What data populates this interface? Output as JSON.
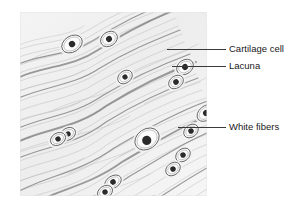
{
  "figure": {
    "background_color": "#ffffff",
    "ink_color": "#3a3a3a"
  },
  "illustration": {
    "name": "white-fibrocartilage-micrograph-drawing",
    "panel": {
      "x": 20,
      "y": 12,
      "width": 187,
      "height": 184
    },
    "fiber_color": "#8c8c8c",
    "lacuna_fill": "#fbfbfb",
    "nucleus_color": "#2b2b2b",
    "fiber_direction": "lower-left to upper-right wavy bundles",
    "cells": [
      {
        "cx": 52,
        "cy": 32,
        "rx": 11,
        "ry": 8,
        "rot": -32,
        "nx": 52,
        "ny": 32,
        "nr": 3.2
      },
      {
        "cx": 89,
        "cy": 27,
        "rx": 9,
        "ry": 7,
        "rot": -34,
        "nx": 89,
        "ny": 27,
        "nr": 3.0
      },
      {
        "cx": 105,
        "cy": 65,
        "rx": 8,
        "ry": 6,
        "rot": -38,
        "nx": 105,
        "ny": 65,
        "nr": 2.6
      },
      {
        "cx": 165,
        "cy": 55,
        "rx": 9,
        "ry": 7,
        "rot": -36,
        "nx": 165,
        "ny": 55,
        "nr": 3.0
      },
      {
        "cx": 156,
        "cy": 70,
        "rx": 8,
        "ry": 6,
        "rot": -36,
        "nx": 156,
        "ny": 70,
        "nr": 2.8
      },
      {
        "cx": 48,
        "cy": 122,
        "rx": 8,
        "ry": 6,
        "rot": -30,
        "nx": 48,
        "ny": 122,
        "nr": 2.7
      },
      {
        "cx": 38,
        "cy": 127,
        "rx": 8,
        "ry": 6,
        "rot": -30,
        "nx": 38,
        "ny": 127,
        "nr": 2.7
      },
      {
        "cx": 186,
        "cy": 101,
        "rx": 10,
        "ry": 7,
        "rot": -40,
        "nx": 186,
        "ny": 101,
        "nr": 3.0
      },
      {
        "cx": 171,
        "cy": 119,
        "rx": 8,
        "ry": 6,
        "rot": -38,
        "nx": 171,
        "ny": 119,
        "nr": 2.7
      },
      {
        "cx": 127,
        "cy": 127,
        "rx": 13,
        "ry": 10,
        "rot": -34,
        "nx": 126,
        "ny": 128,
        "nr": 4.6
      },
      {
        "cx": 163,
        "cy": 143,
        "rx": 8,
        "ry": 6,
        "rot": -38,
        "nx": 163,
        "ny": 143,
        "nr": 2.7
      },
      {
        "cx": 153,
        "cy": 157,
        "rx": 8,
        "ry": 6,
        "rot": -38,
        "nx": 153,
        "ny": 157,
        "nr": 2.7
      },
      {
        "cx": 93,
        "cy": 170,
        "rx": 9,
        "ry": 6,
        "rot": -32,
        "nx": 93,
        "ny": 170,
        "nr": 2.8
      },
      {
        "cx": 85,
        "cy": 180,
        "rx": 8,
        "ry": 6,
        "rot": -32,
        "nx": 85,
        "ny": 180,
        "nr": 2.7
      },
      {
        "cx": 131,
        "cy": 192,
        "rx": 10,
        "ry": 7,
        "rot": -30,
        "nx": 129,
        "ny": 193,
        "nr": 3.2
      },
      {
        "cx": 198,
        "cy": 126,
        "rx": 8,
        "ry": 6,
        "rot": -42,
        "nx": 198,
        "ny": 126,
        "nr": 2.6
      }
    ]
  },
  "labels": {
    "cartilage_cell": "Cartilage cell",
    "lacuna": "Lacuna",
    "white_fibers": "White fibers"
  },
  "leaders": {
    "cartilage_cell": {
      "x1": 167,
      "y1": 49,
      "x2": 226,
      "y2": 49
    },
    "lacuna": {
      "x1": 172,
      "y1": 66,
      "x2": 226,
      "y2": 66
    },
    "white_fibers": {
      "x1": 178,
      "y1": 127,
      "x2": 226,
      "y2": 127
    }
  }
}
